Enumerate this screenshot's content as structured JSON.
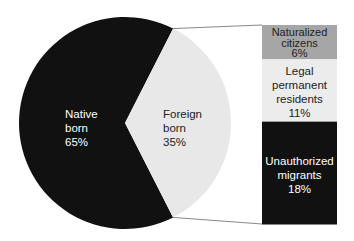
{
  "chart_data": {
    "type": "pie",
    "title": "",
    "pie": {
      "categories": [
        "Native born",
        "Foreign born"
      ],
      "values": [
        65,
        35
      ],
      "colors": [
        "#111111",
        "#e8e8e8"
      ],
      "label_colors": [
        "#ffffff",
        "#222222"
      ]
    },
    "breakdown": {
      "type": "stacked-bar",
      "parent": "Foreign born",
      "categories": [
        "Naturalized citizens",
        "Legal permanent residents",
        "Unauthorized migrants"
      ],
      "values": [
        6,
        11,
        18
      ],
      "colors": [
        "#a6a6a6",
        "#ececec",
        "#111111"
      ],
      "label_colors": [
        "#222222",
        "#222222",
        "#ffffff"
      ]
    },
    "unit": "%"
  },
  "labels": {
    "native": {
      "line1": "Native",
      "line2": "born",
      "value": "65%"
    },
    "foreign": {
      "line1": "Foreign",
      "line2": "born",
      "value": "35%"
    },
    "naturalized": {
      "line1": "Naturalized",
      "line2": "citizens",
      "value": "6%"
    },
    "legal": {
      "line1": "Legal",
      "line2": "permanent",
      "line3": "residents",
      "value": "11%"
    },
    "unauthorized": {
      "line1": "Unauthorized",
      "line2": "migrants",
      "value": "18%"
    }
  }
}
